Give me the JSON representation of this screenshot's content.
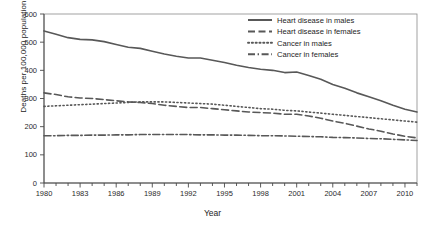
{
  "chart_data": {
    "type": "line",
    "title": "",
    "xlabel": "Year",
    "ylabel": "Deaths per 100,000 population",
    "xlim": [
      1980,
      2011
    ],
    "ylim": [
      0,
      600
    ],
    "yticks": [
      0,
      100,
      200,
      300,
      400,
      500,
      600
    ],
    "xticks": [
      1980,
      1983,
      1986,
      1989,
      1992,
      1995,
      1998,
      2001,
      2004,
      2007,
      2010
    ],
    "xtick_labels": [
      "1980",
      "1983",
      "1986",
      "1989",
      "1992",
      "1995",
      "1998",
      "2001",
      "2004",
      "2007",
      "2010"
    ],
    "ytick_labels": [
      "0",
      "100",
      "200",
      "300",
      "400",
      "500",
      "600"
    ],
    "grid": false,
    "legend_position": "top-right",
    "x": [
      1980,
      1981,
      1982,
      1983,
      1984,
      1985,
      1986,
      1987,
      1988,
      1989,
      1990,
      1991,
      1992,
      1993,
      1994,
      1995,
      1996,
      1997,
      1998,
      1999,
      2000,
      2001,
      2002,
      2003,
      2004,
      2005,
      2006,
      2007,
      2008,
      2009,
      2010,
      2011
    ],
    "series": [
      {
        "name": "Heart disease in males",
        "style": "solid",
        "color": "#585858",
        "values": [
          540,
          528,
          516,
          510,
          508,
          502,
          492,
          482,
          478,
          468,
          458,
          450,
          444,
          444,
          436,
          428,
          418,
          410,
          404,
          400,
          392,
          394,
          382,
          368,
          350,
          336,
          320,
          306,
          292,
          276,
          262,
          252
        ]
      },
      {
        "name": "Heart disease in females",
        "style": "dashed",
        "color": "#585858",
        "values": [
          320,
          314,
          306,
          302,
          300,
          296,
          292,
          288,
          286,
          282,
          276,
          272,
          268,
          268,
          264,
          260,
          256,
          252,
          250,
          248,
          244,
          244,
          238,
          230,
          220,
          212,
          202,
          192,
          184,
          174,
          166,
          160
        ]
      },
      {
        "name": "Cancer in males",
        "style": "dotted",
        "color": "#585858",
        "values": [
          272,
          274,
          276,
          278,
          280,
          282,
          284,
          286,
          288,
          288,
          288,
          286,
          284,
          282,
          280,
          276,
          272,
          268,
          264,
          262,
          258,
          256,
          252,
          248,
          244,
          240,
          236,
          232,
          228,
          224,
          220,
          216
        ]
      },
      {
        "name": "Cancer in females",
        "style": "dashdot",
        "color": "#585858",
        "values": [
          168,
          168,
          169,
          169,
          170,
          170,
          171,
          171,
          172,
          172,
          172,
          172,
          172,
          171,
          171,
          170,
          170,
          169,
          168,
          168,
          167,
          166,
          165,
          164,
          162,
          161,
          160,
          158,
          157,
          155,
          153,
          151
        ]
      }
    ]
  },
  "legend": {
    "items": [
      {
        "label": "Heart disease in males",
        "style": "solid"
      },
      {
        "label": "Heart disease in females",
        "style": "dashed"
      },
      {
        "label": "Cancer in males",
        "style": "dotted"
      },
      {
        "label": "Cancer in females",
        "style": "dashdot"
      }
    ]
  }
}
